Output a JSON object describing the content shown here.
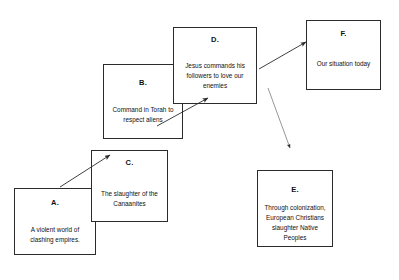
{
  "diagram": {
    "type": "flow-diagram",
    "background_color": "#ffffff",
    "stroke_color": "#2b2b2b",
    "text_color": "#111111",
    "nodes": [
      {
        "id": "a",
        "label": "A.",
        "text": "A violent world of clashing empires."
      },
      {
        "id": "b",
        "label": "B.",
        "text": "Command in Torah to respect aliens"
      },
      {
        "id": "c",
        "label": "C.",
        "text": "The slaughter of the Canaanites"
      },
      {
        "id": "d",
        "label": "D.",
        "text": "Jesus commands his followers to love our enemies"
      },
      {
        "id": "e",
        "label": "E.",
        "text": "Through colonization, European Christians slaughter Native Peoples"
      },
      {
        "id": "f",
        "label": "F.",
        "text": "Our situation today"
      }
    ],
    "edges": [
      {
        "id": "a-to-c",
        "from": "a",
        "to": "c",
        "x1": 60,
        "y1": 187,
        "x2": 110,
        "y2": 155
      },
      {
        "id": "b-to-d",
        "from": "b",
        "to": "d",
        "x1": 157,
        "y1": 126,
        "x2": 208,
        "y2": 98
      },
      {
        "id": "d-to-f",
        "from": "d",
        "to": "f",
        "x1": 259,
        "y1": 69,
        "x2": 306,
        "y2": 42
      },
      {
        "id": "d-to-e",
        "from": "d",
        "to": "e",
        "x1": 268,
        "y1": 88,
        "x2": 290,
        "y2": 148
      }
    ]
  }
}
